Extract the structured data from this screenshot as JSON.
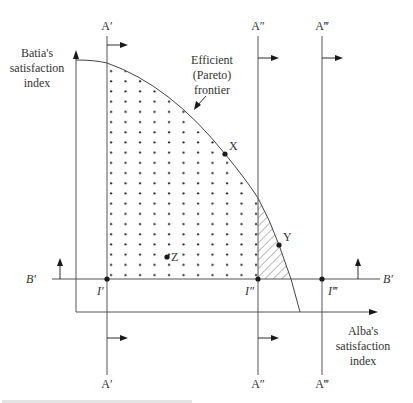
{
  "labels": {
    "y_axis_line1": "Batia's",
    "y_axis_line2": "satisfaction",
    "y_axis_line3": "index",
    "x_axis_line1": "Alba's",
    "x_axis_line2": "satisfaction",
    "x_axis_line3": "index",
    "frontier_line1": "Efficient",
    "frontier_line2": "(Pareto)",
    "frontier_line3": "frontier",
    "a1_top": "A′",
    "a2_top": "A″",
    "a3_top": "A‴",
    "a1_bottom": "A′",
    "a2_bottom": "A″",
    "a3_bottom": "A‴",
    "b_left": "B′",
    "b_right": "B′",
    "i1": "I′",
    "i2": "I″",
    "i3": "I‴",
    "point_x": "X",
    "point_y": "Y",
    "point_z": "Z"
  },
  "colors": {
    "line": "#555555",
    "ink": "#1a1a1a",
    "background": "#ffffff"
  }
}
